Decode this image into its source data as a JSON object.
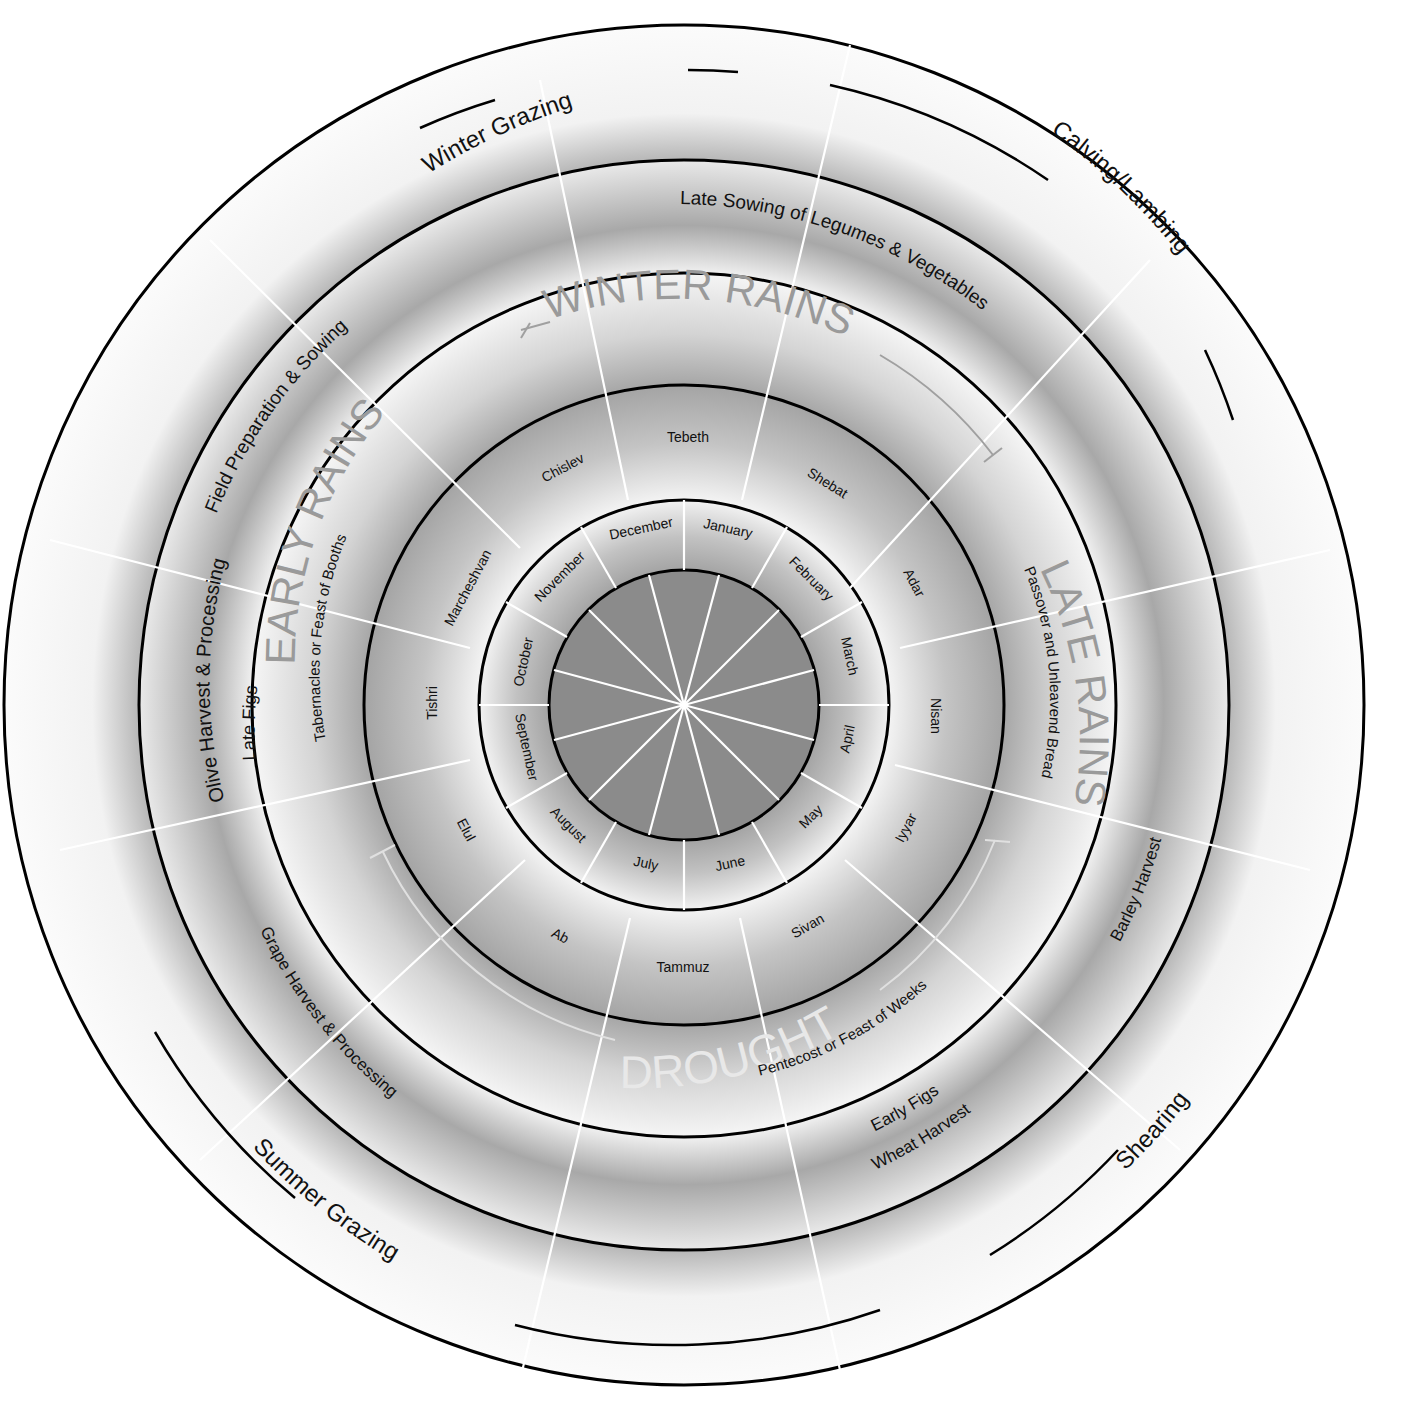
{
  "diagram": {
    "colors": {
      "background": "#ffffff",
      "ring_light": "#f4f4f4",
      "ring_dark": "#9e9e9e",
      "center_disc": "#8a8a8a",
      "ring_stroke": "#000000",
      "spokes": "#ffffff",
      "season_label": "#9a9a9a",
      "drought_label": "#e8e8e8"
    },
    "center": {
      "x": 684,
      "y": 705
    },
    "rings": [
      {
        "name": "center-disc",
        "r": 135
      },
      {
        "name": "gregorian-months",
        "r": 205
      },
      {
        "name": "hebrew-months",
        "r": 320
      },
      {
        "name": "seasons-and-feasts",
        "r": 432
      },
      {
        "name": "crops",
        "r": 545
      },
      {
        "name": "livestock",
        "r": 680
      }
    ],
    "gregorian_months": [
      "January",
      "February",
      "March",
      "April",
      "May",
      "June",
      "July",
      "August",
      "September",
      "October",
      "November",
      "December"
    ],
    "hebrew_months": [
      "Tebeth",
      "Shebat",
      "Adar",
      "Nisan",
      "Iyyar",
      "Sivan",
      "Tammuz",
      "Ab",
      "Elul",
      "Tishri",
      "Marcheshvan",
      "Chislev"
    ],
    "seasons": {
      "winter_rains": "WINTER RAINS",
      "early_rains": "EARLY RAINS",
      "late_rains": "LATE RAINS",
      "drought": "DROUGHT"
    },
    "feasts": {
      "tabernacles": "Tabernacles or Feast of Booths",
      "passover": "Passover and Unleavend Bread",
      "pentecost": "Pentecost or Feast of Weeks"
    },
    "crop_activities": {
      "field_prep": "Field Preparation & Sowing",
      "late_sowing": "Late Sowing of Legumes & Vegetables",
      "olive_harvest": "Olive Harvest & Processing",
      "late_figs": "Late Figs",
      "barley_harvest": "Barley Harvest",
      "early_figs": "Early Figs",
      "wheat_harvest": "Wheat Harvest",
      "grape_harvest": "Grape Harvest & Processing"
    },
    "livestock_activities": {
      "winter_grazing": "Winter Grazing",
      "calving": "Calving/Lambing",
      "shearing": "Shearing",
      "summer_grazing": "Summer Grazing"
    }
  }
}
